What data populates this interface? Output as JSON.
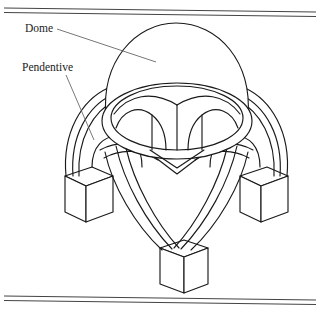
{
  "figure": {
    "background_color": "#ffffff",
    "line_color": "#1a1a1a",
    "leader_color": "#555555",
    "rule_color": "#444444",
    "labels": [
      {
        "id": "dome",
        "text": "Dome",
        "x": 25,
        "y": 32,
        "leader": {
          "x1": 57,
          "y1": 29,
          "x2": 156,
          "y2": 62
        }
      },
      {
        "id": "pendentive",
        "text": "Pendentive",
        "x": 22,
        "y": 71,
        "leader": {
          "x1": 66,
          "y1": 75,
          "x2": 94,
          "y2": 140
        }
      }
    ],
    "rules": {
      "top": [
        {
          "x1": 4,
          "y1": 8,
          "x2": 316,
          "y2": 12
        },
        {
          "x1": 4,
          "y1": 12,
          "x2": 316,
          "y2": 16
        }
      ],
      "bottom": [
        {
          "x1": 4,
          "y1": 296,
          "x2": 316,
          "y2": 300
        },
        {
          "x1": 4,
          "y1": 300,
          "x2": 316,
          "y2": 304
        }
      ]
    },
    "parts": [
      {
        "name": "dome-shell",
        "description": "Hemispherical dome cap"
      },
      {
        "name": "drum-ring",
        "description": "Elliptical drum ring below dome"
      },
      {
        "name": "pendentive-vaults",
        "description": "Curved triangular pendentives inside drum"
      },
      {
        "name": "arch-left",
        "description": "Supporting arch to left pier"
      },
      {
        "name": "arch-right",
        "description": "Supporting arch to right pier"
      },
      {
        "name": "arch-front",
        "description": "Supporting arch to front pier"
      },
      {
        "name": "pier-left",
        "description": "Isometric box pier, left"
      },
      {
        "name": "pier-right",
        "description": "Isometric box pier, right"
      },
      {
        "name": "pier-front",
        "description": "Isometric box pier, front center"
      }
    ]
  }
}
